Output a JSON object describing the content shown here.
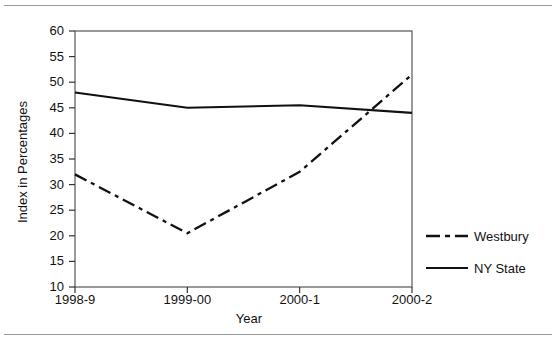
{
  "chart_data": {
    "type": "line",
    "title": "",
    "xlabel": "Year",
    "ylabel": "Index in Percentages",
    "categories": [
      "1998-9",
      "1999-00",
      "2000-1",
      "2000-2"
    ],
    "ylim": [
      10,
      60
    ],
    "yticks": [
      10,
      15,
      20,
      25,
      30,
      35,
      40,
      45,
      50,
      55,
      60
    ],
    "ytick_labels": [
      "10",
      "15",
      "20",
      "25",
      "30",
      "35",
      "40",
      "45",
      "50",
      "55",
      "60"
    ],
    "grid": false,
    "legend_position": "right",
    "series": [
      {
        "name": "Westbury",
        "style": "dash-dot",
        "color": "#111111",
        "values": [
          32,
          20.5,
          32.5,
          51.5
        ]
      },
      {
        "name": "NY State",
        "style": "solid",
        "color": "#111111",
        "values": [
          48,
          45,
          45.5,
          44
        ]
      }
    ]
  },
  "axes": {
    "y_label": "Index in Percentages",
    "x_label": "Year"
  },
  "legend": {
    "items": [
      {
        "label": "Westbury",
        "style": "dash-dot"
      },
      {
        "label": "NY State",
        "style": "solid"
      }
    ]
  }
}
